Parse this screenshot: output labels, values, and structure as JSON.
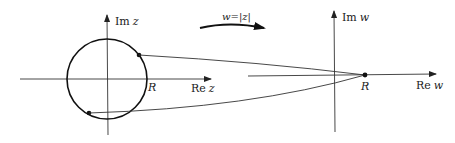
{
  "diagram": {
    "left_plane": {
      "imag_axis_label": "Im z",
      "imag_axis_label_prefix": "Im",
      "imag_axis_label_var": "z",
      "real_axis_label": "Re z",
      "real_axis_label_prefix": "Re",
      "real_axis_label_var": "z",
      "radius_label": "R",
      "circle": {
        "cx": 107,
        "cy": 79,
        "r": 40
      },
      "points": [
        {
          "x": 139,
          "y": 55
        },
        {
          "x": 89,
          "y": 113
        }
      ]
    },
    "mapping": {
      "label": "w=|z|",
      "label_lhs": "w",
      "label_eq": "=|",
      "label_var": "z",
      "label_end": "|"
    },
    "right_plane": {
      "imag_axis_label": "Im w",
      "imag_axis_label_prefix": "Im",
      "imag_axis_label_var": "w",
      "real_axis_label": "Re w",
      "real_axis_label_prefix": "Re",
      "real_axis_label_var": "w",
      "point_label": "R",
      "point": {
        "x": 365,
        "y": 75
      }
    },
    "colors": {
      "stroke": "#1a1a1a",
      "axis": "#333333"
    }
  }
}
